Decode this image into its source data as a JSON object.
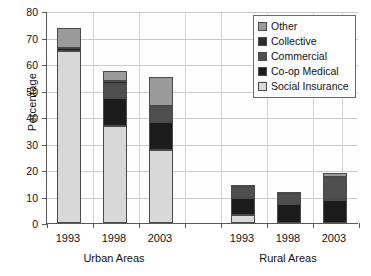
{
  "chart_data": {
    "type": "bar",
    "subtype": "stacked-bar",
    "title": "",
    "xlabel": "",
    "ylabel": "Percentage",
    "ylim": [
      0,
      80
    ],
    "ytick_step": 10,
    "yticks": [
      0,
      10,
      20,
      30,
      40,
      50,
      60,
      70,
      80
    ],
    "grid": true,
    "legend_position": "top-right",
    "categories": [
      "1993",
      "1998",
      "2003",
      "1993",
      "1998",
      "2003"
    ],
    "groups": [
      {
        "label": "Urban Areas",
        "categories": [
          "1993",
          "1998",
          "2003"
        ]
      },
      {
        "label": "Rural Areas",
        "categories": [
          "1993",
          "1998",
          "2003"
        ]
      }
    ],
    "stack_order_bottom_to_top": [
      "Social Insurance",
      "Co-op Medical",
      "Commercial",
      "Collective",
      "Other"
    ],
    "series": [
      {
        "name": "Social Insurance",
        "color": "#d8d8d8",
        "values": [
          65.0,
          36.5,
          27.5,
          3.2,
          0.0,
          0.0
        ]
      },
      {
        "name": "Co-op Medical",
        "color": "#1c1c1c",
        "values": [
          1.0,
          10.5,
          10.5,
          6.3,
          7.0,
          8.5
        ]
      },
      {
        "name": "Commercial",
        "color": "#4f4f4f",
        "values": [
          0.0,
          5.3,
          6.0,
          4.2,
          4.0,
          9.0
        ]
      },
      {
        "name": "Collective",
        "color": "#2b2b2b",
        "values": [
          0.0,
          1.2,
          0.0,
          0.0,
          0.0,
          0.0
        ]
      },
      {
        "name": "Other",
        "color": "#9b9b9b",
        "values": [
          7.5,
          3.7,
          11.0,
          0.8,
          0.5,
          1.5
        ]
      }
    ],
    "totals": [
      73.5,
      57.2,
      55.0,
      14.5,
      11.5,
      19.0
    ]
  },
  "axes": {
    "y": {
      "label": "Percentage",
      "ticks": [
        "80",
        "70",
        "60",
        "50",
        "40",
        "30",
        "20",
        "10",
        "0"
      ]
    },
    "x": {
      "tick_labels": [
        "1993",
        "1998",
        "2003",
        "1993",
        "1998",
        "2003"
      ],
      "group_labels": [
        "Urban Areas",
        "Rural Areas"
      ]
    }
  },
  "legend": {
    "items": [
      {
        "label": "Other",
        "color": "#9b9b9b"
      },
      {
        "label": "Collective",
        "color": "#2b2b2b"
      },
      {
        "label": "Commercial",
        "color": "#4f4f4f"
      },
      {
        "label": "Co-op Medical",
        "color": "#1c1c1c"
      },
      {
        "label": "Social Insurance",
        "color": "#d8d8d8"
      }
    ]
  }
}
